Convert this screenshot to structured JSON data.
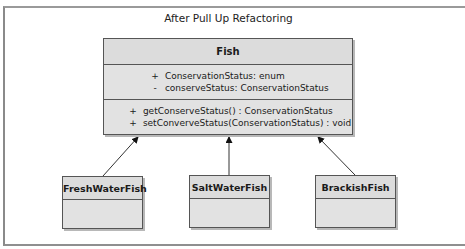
{
  "diagram": {
    "title": "After Pull Up Refactoring",
    "superclass": {
      "name": "Fish",
      "attributes": [
        {
          "visibility": "+",
          "text": "ConservationStatus:  enum"
        },
        {
          "visibility": "-",
          "text": "conserveStatus:  ConservationStatus"
        }
      ],
      "operations": [
        {
          "visibility": "+",
          "text": "getConserveStatus() : ConservationStatus"
        },
        {
          "visibility": "+",
          "text": "setConverveStatus(ConservationStatus) : void"
        }
      ]
    },
    "subclasses": [
      {
        "name": "FreshWaterFish"
      },
      {
        "name": "SaltWaterFish"
      },
      {
        "name": "BrackishFish"
      }
    ],
    "relationships": [
      {
        "from": "FreshWaterFish",
        "to": "Fish",
        "type": "generalization"
      },
      {
        "from": "SaltWaterFish",
        "to": "Fish",
        "type": "generalization"
      },
      {
        "from": "BrackishFish",
        "to": "Fish",
        "type": "generalization"
      }
    ],
    "colors": {
      "box_fill": "#e2e2e2",
      "box_border": "#555555",
      "frame_border": "#8a8a8a"
    }
  }
}
